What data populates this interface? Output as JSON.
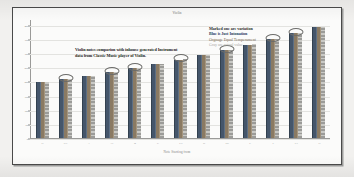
{
  "chart_data": {
    "type": "bar",
    "title": "Violin",
    "xlabel": "Note  Starting  from",
    "ylabel": "",
    "grid": true,
    "legend_position": "top-right",
    "categories": [
      "G",
      "G#",
      "A",
      "A#",
      "B",
      "C",
      "C#",
      "D",
      "D#",
      "E",
      "F",
      "F#",
      "G"
    ],
    "series": [
      {
        "name": "Blue is Just Intonation",
        "color": "#45566b",
        "values": [
          196,
          207,
          220,
          233,
          247,
          262,
          277,
          294,
          311,
          330,
          349,
          370,
          392
        ]
      },
      {
        "name": "Orgnage Equal Temperament",
        "color": "#8a7a63",
        "values": [
          196,
          208,
          220,
          233,
          247,
          262,
          277,
          294,
          311,
          330,
          349,
          370,
          392
        ]
      },
      {
        "name": "Gray are actual value",
        "color": "#b4b4b0",
        "values": [
          196,
          207,
          220,
          234,
          247,
          261,
          278,
          294,
          312,
          331,
          350,
          371,
          392
        ]
      }
    ],
    "ylim": [
      0,
      420
    ],
    "yticks": [
      0,
      50,
      100,
      150,
      200,
      250,
      300,
      350,
      400
    ],
    "marked_groups": [
      1,
      3,
      4,
      6,
      8,
      10,
      11
    ],
    "marked_note": "Marked one are variation"
  },
  "legend": {
    "lines": [
      "Marked one are variation",
      "Blue is Just Intonation",
      "Orgnage Equal Temperament",
      "Gray are actual value"
    ]
  },
  "annotation": {
    "text": "Violin notes comparion with inhouse generated Instrument data from Classic Music player of Violin."
  }
}
